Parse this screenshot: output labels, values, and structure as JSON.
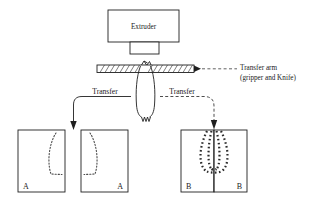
{
  "diagram": {
    "title_present": false,
    "background_color": "#ffffff",
    "line_color": "#1f1f1f"
  },
  "extruder": {
    "label": "Extruder",
    "die_label": ""
  },
  "transfer_arm": {
    "label_line1": "Transfer arm",
    "label_line2": "(gripper and Knife)",
    "hatched": true
  },
  "transfer_left": {
    "label": "Transfer",
    "arrow_style": "solid"
  },
  "transfer_right": {
    "label": "Transfer",
    "arrow_style": "dashed"
  },
  "molds": {
    "left_group": [
      {
        "label": "A",
        "label_position": "bottom-left",
        "parison_side": "right"
      },
      {
        "label": "A",
        "label_position": "bottom-right",
        "parison_side": "left"
      }
    ],
    "right_group": [
      {
        "label": "B",
        "label_position": "bottom-left",
        "parison_side": "right"
      },
      {
        "label": "B",
        "label_position": "bottom-right",
        "parison_side": "left"
      }
    ]
  },
  "parison": {
    "shape": "tube",
    "bottom": "zigzag"
  }
}
